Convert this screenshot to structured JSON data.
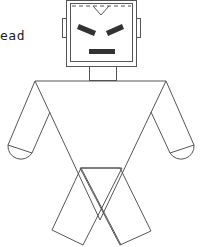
{
  "diagram": {
    "labels": [
      {
        "id": "head-label",
        "text": "ead",
        "x": 0,
        "y": 28
      }
    ],
    "colors": {
      "stroke": "#555555",
      "features": "#333333",
      "background": "#ffffff"
    },
    "parts": [
      "head",
      "ears",
      "eyes",
      "mouth",
      "neck",
      "body",
      "arms",
      "hands",
      "legs"
    ]
  }
}
